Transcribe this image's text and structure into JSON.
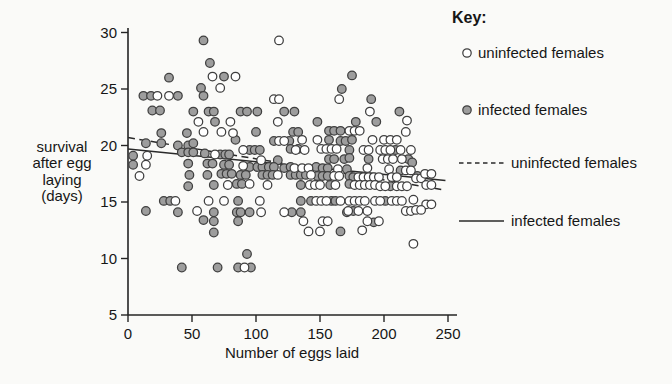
{
  "colors": {
    "background": "#fafaf8",
    "axis": "#242424",
    "text": "#161616",
    "open_point_fill": "#ffffff",
    "point_stroke": "#3f3f3f",
    "filled_point_fill": "#9d9d9d",
    "trend_line": "#2a2a2a"
  },
  "chart_data": {
    "type": "scatter",
    "title": "",
    "xlabel": "Number of eggs laid",
    "ylabel": "survival after egg laying (days)",
    "ylabel_lines": [
      "survival",
      "after egg",
      "laying",
      "(days)"
    ],
    "xlim": [
      0,
      250
    ],
    "ylim": [
      5,
      30
    ],
    "x_ticks": [
      0,
      50,
      100,
      150,
      200,
      250
    ],
    "y_ticks": [
      5,
      10,
      15,
      20,
      25,
      30
    ],
    "grid": false,
    "legend_position": "right",
    "key": {
      "title": "Key:",
      "items": [
        {
          "marker": "open-circle",
          "label": "uninfected females"
        },
        {
          "marker": "filled-circle",
          "label": "infected females"
        },
        {
          "marker": "dashed-line",
          "label": "uninfected females"
        },
        {
          "marker": "solid-line",
          "label": "infected females"
        }
      ]
    },
    "series": [
      {
        "name": "uninfected females",
        "marker": "open",
        "points": [
          [
            118,
            29.3
          ],
          [
            66,
            26.1
          ],
          [
            84,
            26.1
          ],
          [
            72,
            25.1
          ],
          [
            23,
            24.4
          ],
          [
            32,
            24.4
          ],
          [
            114,
            24.1
          ],
          [
            118,
            24.1
          ],
          [
            165,
            24.1
          ],
          [
            189,
            23.0
          ],
          [
            55,
            22.1
          ],
          [
            80,
            22.1
          ],
          [
            117,
            22.1
          ],
          [
            218,
            22.2
          ],
          [
            59,
            21.2
          ],
          [
            73,
            21.2
          ],
          [
            82,
            21.1
          ],
          [
            173,
            21.3
          ],
          [
            177,
            21.3
          ],
          [
            181,
            21.3
          ],
          [
            217,
            21.2
          ],
          [
            136,
            20.5
          ],
          [
            148,
            20.5
          ],
          [
            118,
            20.4
          ],
          [
            122,
            20.4
          ],
          [
            191,
            20.5
          ],
          [
            200,
            20.5
          ],
          [
            205,
            20.5
          ],
          [
            210,
            20.5
          ],
          [
            90,
            19.6
          ],
          [
            131,
            19.6
          ],
          [
            138,
            19.6
          ],
          [
            151,
            19.7
          ],
          [
            155,
            19.7
          ],
          [
            159,
            19.7
          ],
          [
            163,
            19.7
          ],
          [
            184,
            19.6
          ],
          [
            188,
            19.6
          ],
          [
            197,
            19.6
          ],
          [
            201,
            19.6
          ],
          [
            205,
            19.6
          ],
          [
            213,
            19.6
          ],
          [
            221,
            19.6
          ],
          [
            15,
            19.1
          ],
          [
            68,
            19.2
          ],
          [
            104,
            18.7
          ],
          [
            199,
            18.8
          ],
          [
            203,
            18.8
          ],
          [
            207,
            18.8
          ],
          [
            214,
            18.8
          ],
          [
            14,
            18.3
          ],
          [
            90,
            18.2
          ],
          [
            130,
            18.0
          ],
          [
            136,
            18.0
          ],
          [
            141,
            18.0
          ],
          [
            164,
            17.9
          ],
          [
            187,
            18.0
          ],
          [
            204,
            17.9
          ],
          [
            9,
            17.3
          ],
          [
            117,
            17.4
          ],
          [
            143,
            17.4
          ],
          [
            161,
            17.3
          ],
          [
            165,
            17.3
          ],
          [
            180,
            17.2
          ],
          [
            184,
            17.2
          ],
          [
            188,
            17.2
          ],
          [
            192,
            17.2
          ],
          [
            196,
            17.2
          ],
          [
            206,
            17.2
          ],
          [
            210,
            17.2
          ],
          [
            217,
            17.8
          ],
          [
            221,
            17.8
          ],
          [
            225,
            17.1
          ],
          [
            229,
            17.1
          ],
          [
            232,
            17.5
          ],
          [
            237,
            17.5
          ],
          [
            78,
            16.5
          ],
          [
            95,
            16.6
          ],
          [
            109,
            16.5
          ],
          [
            142,
            16.5
          ],
          [
            146,
            16.5
          ],
          [
            150,
            16.5
          ],
          [
            162,
            16.5
          ],
          [
            177,
            16.5
          ],
          [
            181,
            16.5
          ],
          [
            185,
            16.5
          ],
          [
            189,
            16.5
          ],
          [
            193,
            16.5
          ],
          [
            197,
            16.4
          ],
          [
            201,
            16.4
          ],
          [
            210,
            16.4
          ],
          [
            214,
            16.4
          ],
          [
            218,
            16.4
          ],
          [
            233,
            16.5
          ],
          [
            237,
            16.5
          ],
          [
            37,
            15.1
          ],
          [
            63,
            15.1
          ],
          [
            75,
            15.1
          ],
          [
            103,
            15.1
          ],
          [
            147,
            15.1
          ],
          [
            151,
            15.1
          ],
          [
            155,
            15.1
          ],
          [
            166,
            15.1
          ],
          [
            173,
            15.1
          ],
          [
            177,
            15.1
          ],
          [
            181,
            15.1
          ],
          [
            185,
            15.1
          ],
          [
            193,
            15.1
          ],
          [
            197,
            15.1
          ],
          [
            206,
            15.1
          ],
          [
            210,
            15.1
          ],
          [
            214,
            15.1
          ],
          [
            223,
            15.2
          ],
          [
            233,
            14.8
          ],
          [
            237,
            14.8
          ],
          [
            54,
            14.2
          ],
          [
            104,
            14.1
          ],
          [
            122,
            14.1
          ],
          [
            172,
            14.2
          ],
          [
            180,
            14.2
          ],
          [
            187,
            14.2
          ],
          [
            217,
            14.2
          ],
          [
            221,
            14.2
          ],
          [
            225,
            14.3
          ],
          [
            229,
            14.3
          ],
          [
            137,
            13.3
          ],
          [
            152,
            13.3
          ],
          [
            156,
            13.3
          ],
          [
            187,
            13.3
          ],
          [
            196,
            13.3
          ],
          [
            141,
            12.4
          ],
          [
            150,
            12.4
          ],
          [
            183,
            12.5
          ],
          [
            223,
            11.3
          ],
          [
            91,
            9.2
          ]
        ]
      },
      {
        "name": "infected females",
        "marker": "filled",
        "points": [
          [
            59,
            29.3
          ],
          [
            64,
            27.3
          ],
          [
            32,
            26.0
          ],
          [
            75,
            26.1
          ],
          [
            175,
            26.2
          ],
          [
            57,
            25.1
          ],
          [
            167,
            25.0
          ],
          [
            12,
            24.4
          ],
          [
            18,
            24.4
          ],
          [
            39,
            24.4
          ],
          [
            59,
            24.4
          ],
          [
            190,
            24.1
          ],
          [
            19,
            23.1
          ],
          [
            25,
            23.1
          ],
          [
            51,
            23.0
          ],
          [
            63,
            23.0
          ],
          [
            67,
            23.0
          ],
          [
            88,
            23.0
          ],
          [
            93,
            23.0
          ],
          [
            101,
            23.0
          ],
          [
            122,
            23.0
          ],
          [
            130,
            23.0
          ],
          [
            212,
            23.0
          ],
          [
            68,
            22.1
          ],
          [
            148,
            22.1
          ],
          [
            178,
            22.1
          ],
          [
            194,
            22.1
          ],
          [
            26,
            21.1
          ],
          [
            46,
            21.1
          ],
          [
            100,
            21.2
          ],
          [
            129,
            21.2
          ],
          [
            133,
            21.2
          ],
          [
            157,
            21.3
          ],
          [
            161,
            21.3
          ],
          [
            166,
            21.3
          ],
          [
            14,
            20.2
          ],
          [
            26,
            20.2
          ],
          [
            39,
            20.0
          ],
          [
            47,
            20.0
          ],
          [
            51,
            20.2
          ],
          [
            84,
            20.5
          ],
          [
            114,
            20.4
          ],
          [
            126,
            20.4
          ],
          [
            157,
            20.5
          ],
          [
            166,
            20.4
          ],
          [
            170,
            20.4
          ],
          [
            175,
            20.5
          ],
          [
            42,
            19.4
          ],
          [
            47,
            19.4
          ],
          [
            51,
            19.4
          ],
          [
            60,
            19.3
          ],
          [
            72,
            19.2
          ],
          [
            76,
            19.2
          ],
          [
            79,
            19.2
          ],
          [
            4,
            19.1
          ],
          [
            95,
            19.6
          ],
          [
            99,
            19.6
          ],
          [
            103,
            19.6
          ],
          [
            127,
            19.7
          ],
          [
            133,
            19.7
          ],
          [
            173,
            19.6
          ],
          [
            209,
            19.6
          ],
          [
            4,
            18.3
          ],
          [
            47,
            18.4
          ],
          [
            62,
            18.4
          ],
          [
            66,
            18.4
          ],
          [
            75,
            18.3
          ],
          [
            79,
            18.3
          ],
          [
            117,
            18.7
          ],
          [
            157,
            18.8
          ],
          [
            161,
            18.8
          ],
          [
            169,
            18.8
          ],
          [
            173,
            18.9
          ],
          [
            188,
            18.8
          ],
          [
            219,
            18.8
          ],
          [
            222,
            18.5
          ],
          [
            95,
            18.1
          ],
          [
            101,
            18.1
          ],
          [
            105,
            18.1
          ],
          [
            110,
            18.1
          ],
          [
            114,
            18.1
          ],
          [
            122,
            18.0
          ],
          [
            127,
            18.1
          ],
          [
            147,
            18.1
          ],
          [
            152,
            18.0
          ],
          [
            156,
            18.0
          ],
          [
            171,
            17.9
          ],
          [
            48,
            17.4
          ],
          [
            62,
            17.4
          ],
          [
            73,
            17.5
          ],
          [
            77,
            17.5
          ],
          [
            81,
            17.5
          ],
          [
            88,
            17.4
          ],
          [
            92,
            17.4
          ],
          [
            105,
            17.4
          ],
          [
            109,
            17.4
          ],
          [
            113,
            17.4
          ],
          [
            127,
            17.4
          ],
          [
            131,
            17.4
          ],
          [
            135,
            17.4
          ],
          [
            139,
            17.4
          ],
          [
            148,
            17.3
          ],
          [
            152,
            17.3
          ],
          [
            156,
            17.3
          ],
          [
            173,
            17.3
          ],
          [
            176,
            17.2
          ],
          [
            213,
            17.8
          ],
          [
            226,
            17.3
          ],
          [
            47,
            16.4
          ],
          [
            67,
            16.5
          ],
          [
            85,
            16.6
          ],
          [
            89,
            16.6
          ],
          [
            135,
            16.5
          ],
          [
            158,
            16.5
          ],
          [
            173,
            16.6
          ],
          [
            205,
            16.4
          ],
          [
            28,
            15.1
          ],
          [
            33,
            15.1
          ],
          [
            86,
            15.1
          ],
          [
            135,
            15.1
          ],
          [
            143,
            15.1
          ],
          [
            159,
            15.1
          ],
          [
            162,
            15.1
          ],
          [
            201,
            15.1
          ],
          [
            14,
            14.2
          ],
          [
            39,
            14.1
          ],
          [
            67,
            14.1
          ],
          [
            85,
            14.1
          ],
          [
            88,
            14.1
          ],
          [
            95,
            14.1
          ],
          [
            128,
            14.1
          ],
          [
            135,
            14.1
          ],
          [
            171,
            14.1
          ],
          [
            176,
            14.2
          ],
          [
            59,
            13.4
          ],
          [
            67,
            13.3
          ],
          [
            86,
            13.3
          ],
          [
            192,
            13.2
          ],
          [
            67,
            12.3
          ],
          [
            166,
            12.4
          ],
          [
            93,
            10.4
          ],
          [
            42,
            9.2
          ],
          [
            70,
            9.2
          ],
          [
            86,
            9.2
          ],
          [
            96,
            9.2
          ]
        ]
      }
    ],
    "trend_lines": [
      {
        "name": "uninfected females",
        "style": "dashed",
        "from": [
          0,
          20.7
        ],
        "to": [
          245,
          16.1
        ]
      },
      {
        "name": "infected females",
        "style": "solid",
        "from": [
          0,
          19.7
        ],
        "to": [
          248,
          16.9
        ]
      }
    ]
  }
}
